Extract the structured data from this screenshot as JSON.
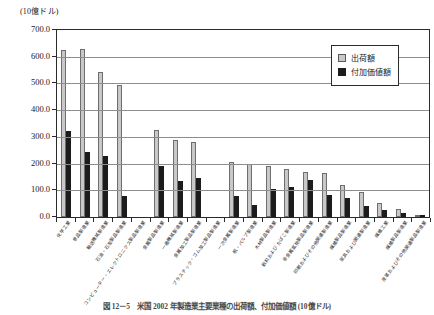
{
  "unit_label": "(10億ドル)",
  "legend": {
    "items": [
      {
        "label": "出荷額",
        "key": "shipment",
        "color": "#c8c8c8"
      },
      {
        "label": "付加価値額",
        "key": "value_added",
        "color": "#1c1c1c"
      }
    ]
  },
  "caption": "図 12－5　米国 2002 年製造業主要業種の出荷額、付加価値額 (10億ドル)",
  "chart_data": {
    "type": "bar",
    "title": "",
    "xlabel": "",
    "ylabel": "(10億ドル)",
    "ylim": [
      0,
      700
    ],
    "ytick_step": 100,
    "grid": true,
    "legend_position": "top-right",
    "ytick_labels": [
      "700.0",
      "600.0",
      "500.0",
      "400.0",
      "300.0",
      "200.0",
      "100.0",
      "0.0"
    ],
    "categories": [
      "化学工業",
      "食品製造業",
      "輸送機械製造業",
      "石油・石炭製品製造業",
      "コンピューター・エレクトロニクス製品製造業",
      "金属製品製造業",
      "一般機械製造業",
      "金属加工製品製造業",
      "プラスチック・ゴム加工製品製造業",
      "一次金属製造業",
      "紙・パルプ製造業",
      "木材製品製造業",
      "飲料および たばこ製造業",
      "非金属鉱物製品製造業",
      "印刷およびその他関連製造業",
      "繊維製品製造業",
      "家具および関連製造業",
      "繊維工業",
      "繊維製品製造業",
      "皮革およびその他関連製品製造業"
    ],
    "series": [
      {
        "name": "出荷額",
        "color": "#c8c8c8",
        "values": [
          625,
          628,
          543,
          494,
          0,
          325,
          288,
          280,
          0,
          205,
          200,
          192,
          178,
          167,
          166,
          120,
          95,
          52,
          30,
          8
        ]
      },
      {
        "name": "付加価値額",
        "color": "#1c1c1c",
        "values": [
          322,
          245,
          228,
          80,
          0,
          192,
          133,
          147,
          0,
          80,
          45,
          105,
          113,
          140,
          83,
          70,
          40,
          28,
          14,
          4
        ]
      }
    ]
  }
}
